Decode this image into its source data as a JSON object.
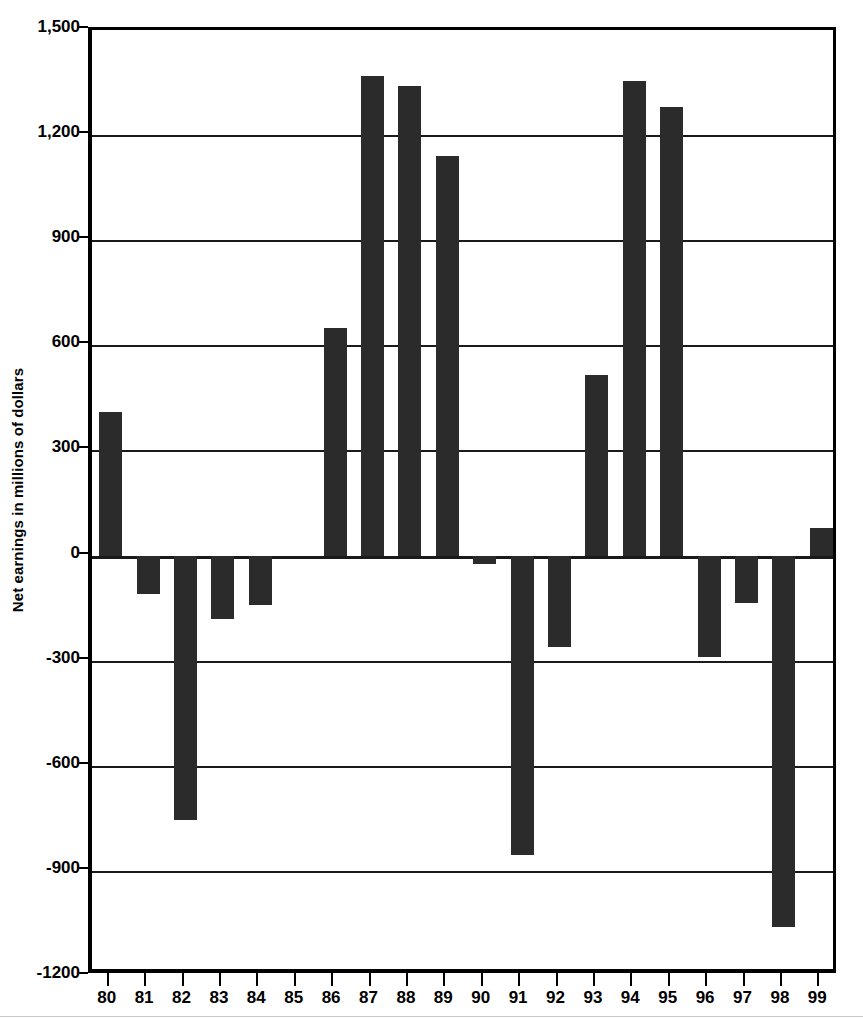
{
  "chart_data": {
    "type": "bar",
    "title": "",
    "subtitle": "",
    "xlabel": "",
    "ylabel": "Net earnings in millions of dollars",
    "categories": [
      "80",
      "81",
      "82",
      "83",
      "84",
      "85",
      "86",
      "87",
      "88",
      "89",
      "90",
      "91",
      "92",
      "93",
      "94",
      "95",
      "96",
      "97",
      "98",
      "99"
    ],
    "values": [
      410,
      -110,
      -755,
      -180,
      -140,
      0,
      650,
      1370,
      1340,
      1140,
      -25,
      -855,
      -260,
      515,
      1355,
      1280,
      -290,
      -135,
      -1060,
      80
    ],
    "series": [
      {
        "name": "Net earnings",
        "values": [
          410,
          -110,
          -755,
          -180,
          -140,
          0,
          650,
          1370,
          1340,
          1140,
          -25,
          -855,
          -260,
          515,
          1355,
          1280,
          -290,
          -135,
          -1060,
          80
        ]
      }
    ],
    "ylim": [
      -1200,
      1500
    ],
    "ytick_values": [
      1500,
      1200,
      900,
      600,
      300,
      0,
      -300,
      -600,
      -900,
      -1200
    ],
    "ytick_labels": [
      "1,500",
      "1,200",
      "900",
      "600",
      "300",
      "0",
      "-300",
      "-600",
      "-900",
      "-1200"
    ],
    "grid": true,
    "grid_axis": "y",
    "legend": "none",
    "bar_color": "#2b2b2b",
    "axis_color": "#000000",
    "background_color": "#ffffff"
  }
}
